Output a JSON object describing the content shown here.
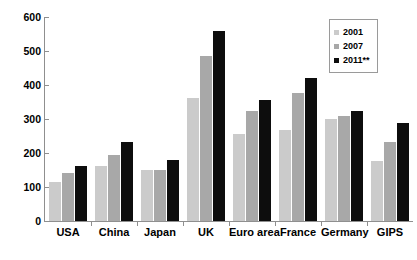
{
  "chart_data": {
    "type": "bar",
    "title": "",
    "subtitle": "",
    "xlabel": "",
    "ylabel": "",
    "ylim": [
      0,
      600
    ],
    "ytick_values": [
      0,
      100,
      200,
      300,
      400,
      500,
      600
    ],
    "ytick_labels": [
      "0",
      "100",
      "200",
      "300",
      "400",
      "500",
      "600"
    ],
    "grid": false,
    "legend_position": "top-right",
    "categories": [
      "USA",
      "China",
      "Japan",
      "UK",
      "Euro area",
      "France",
      "Germany",
      "GIPS"
    ],
    "series": [
      {
        "name": "2001",
        "color": "#cbcbcb",
        "values": [
          115,
          162,
          150,
          362,
          255,
          268,
          300,
          176
        ]
      },
      {
        "name": "2007",
        "color": "#a8a8a8",
        "values": [
          140,
          193,
          151,
          485,
          325,
          376,
          310,
          233
        ]
      },
      {
        "name": "2011**",
        "color": "#0d0d0d",
        "values": [
          163,
          233,
          180,
          560,
          355,
          420,
          325,
          287
        ]
      }
    ]
  },
  "legend": {
    "items": [
      {
        "label": "2001",
        "color": "#cbcbcb"
      },
      {
        "label": "2007",
        "color": "#a8a8a8"
      },
      {
        "label": "2011**",
        "color": "#0d0d0d"
      }
    ]
  },
  "axes": {
    "y_labels": [
      "600",
      "500",
      "400",
      "300",
      "200",
      "100",
      "0"
    ],
    "x_labels": [
      "USA",
      "China",
      "Japan",
      "UK",
      "Euro area",
      "France",
      "Germany",
      "GIPS"
    ]
  }
}
